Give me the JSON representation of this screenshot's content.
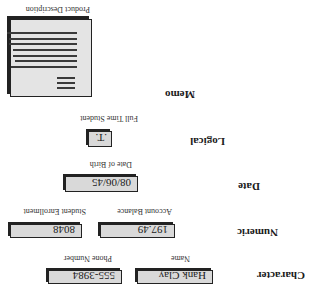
{
  "rows": [
    {
      "type_label": "Character",
      "fields": [
        {
          "caption": "Name",
          "value": "Hank Clay"
        },
        {
          "caption": "Phone Number",
          "value": "555-3984"
        }
      ]
    },
    {
      "type_label": "Numeric",
      "fields": [
        {
          "caption": "Account Balance",
          "value": "197.49"
        },
        {
          "caption": "Student Enrollment",
          "value": "8048"
        }
      ]
    },
    {
      "type_label": "Date",
      "fields": [
        {
          "caption": "Date of Birth",
          "value": "08/06/45"
        }
      ]
    },
    {
      "type_label": "Logical",
      "fields": [
        {
          "caption": "Full Time Student",
          "value": ".T."
        }
      ]
    },
    {
      "type_label": "Memo",
      "fields": [
        {
          "caption": "Product Description",
          "icon": "memo-document-icon"
        }
      ]
    }
  ],
  "orientation": "rotated-180"
}
